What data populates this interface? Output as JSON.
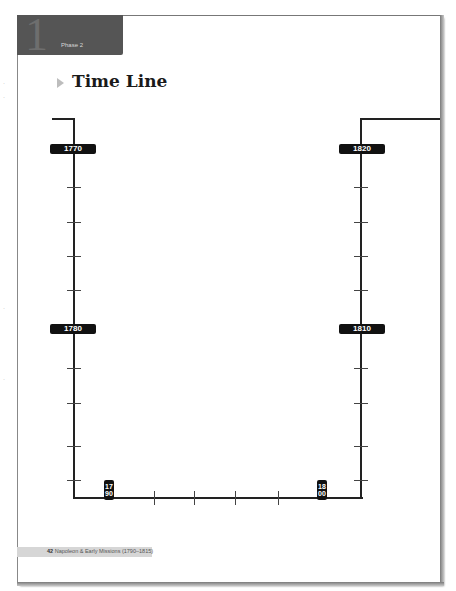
{
  "header": {
    "phase_number": "1",
    "phase_label": "Phase 2"
  },
  "title": "Time Line",
  "timeline": {
    "left_labels": [
      {
        "year": "1770",
        "top": 144
      },
      {
        "year": "1780",
        "top": 324
      }
    ],
    "right_labels": [
      {
        "year": "1820",
        "top": 144
      },
      {
        "year": "1810",
        "top": 324
      }
    ],
    "bottom_labels": [
      {
        "year": "1790",
        "left": 104
      },
      {
        "year": "1800",
        "left": 317
      }
    ],
    "left_ticks_y": [
      187,
      222,
      256,
      290,
      368,
      403,
      446,
      480
    ],
    "right_ticks_y": [
      187,
      222,
      256,
      290,
      368,
      403,
      446,
      480
    ],
    "bottom_ticks_x": [
      154,
      194,
      235,
      278
    ]
  },
  "footer": {
    "page_number": "42",
    "text": "Napoleon & Early Missions (1790–1815)"
  }
}
